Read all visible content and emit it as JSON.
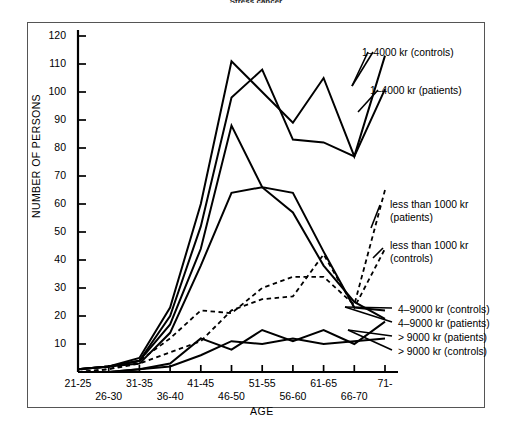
{
  "figure": {
    "title_partial": "Stress cancer",
    "axis_title_x": "AGE",
    "axis_title_y": "NUMBER OF PERSONS"
  },
  "legend": {
    "items": [
      {
        "key": "c1_4000_controls",
        "label": "1–4000 kr (controls)",
        "style": "solid"
      },
      {
        "key": "c1_4000_patients",
        "label": "1–4000 kr (patients)",
        "style": "solid"
      },
      {
        "key": "lt1000_patients_l1",
        "label": "less than 1000 kr",
        "style": "dashed"
      },
      {
        "key": "lt1000_patients_l2",
        "label": "(patients)",
        "style": "dashed"
      },
      {
        "key": "lt1000_controls_l1",
        "label": "less than 1000 kr",
        "style": "dashed"
      },
      {
        "key": "lt1000_controls_l2",
        "label": "(controls)",
        "style": "dashed"
      },
      {
        "key": "c4_9000_controls",
        "label": "4–9000 kr (controls)",
        "style": "solid"
      },
      {
        "key": "c4_9000_patients",
        "label": "4–9000 kr (patients)",
        "style": "solid"
      },
      {
        "key": "gt9000_patients",
        "label": "> 9000 kr (patients)",
        "style": "solid"
      },
      {
        "key": "gt9000_controls",
        "label": "> 9000 kr (controls)",
        "style": "solid"
      }
    ]
  },
  "chart_data": {
    "type": "line",
    "title": "Stress cancer",
    "xlabel": "AGE",
    "ylabel": "NUMBER OF PERSONS",
    "grid": false,
    "legend_position": "right-inline-annotations",
    "ylim": [
      0,
      125
    ],
    "yticks": [
      10,
      20,
      30,
      40,
      50,
      60,
      70,
      80,
      90,
      100,
      110,
      120
    ],
    "categories": [
      "21-25",
      "26-30",
      "31-35",
      "36-40",
      "41-45",
      "46-50",
      "51-55",
      "56-60",
      "61-65",
      "66-70",
      "71-"
    ],
    "series": [
      {
        "name": "1-4000 kr (controls)",
        "style": "solid",
        "values": [
          1,
          2,
          5,
          23,
          60,
          111,
          100,
          89,
          105,
          77,
          113
        ]
      },
      {
        "name": "1-4000 kr (patients)",
        "style": "solid",
        "values": [
          1,
          2,
          4,
          20,
          52,
          98,
          108,
          83,
          82,
          77,
          101
        ]
      },
      {
        "name": "less than 1000 kr (patients)",
        "style": "dashed",
        "values": [
          0,
          1,
          4,
          12,
          22,
          21,
          30,
          34,
          34,
          24,
          65
        ]
      },
      {
        "name": "less than 1000 kr (controls)",
        "style": "dashed",
        "values": [
          0,
          1,
          3,
          7,
          11,
          22,
          26,
          27,
          42,
          23,
          44
        ]
      },
      {
        "name": "4-9000 kr (controls)",
        "style": "solid",
        "values": [
          1,
          2,
          4,
          17,
          44,
          88,
          66,
          64,
          43,
          23,
          22
        ]
      },
      {
        "name": "4-9000 kr (patients)",
        "style": "solid",
        "values": [
          1,
          2,
          3,
          14,
          38,
          64,
          66,
          57,
          38,
          25,
          19
        ]
      },
      {
        "name": "> 9000 kr (patients)",
        "style": "solid",
        "values": [
          0,
          0,
          1,
          3,
          12,
          8,
          15,
          11,
          15,
          10,
          18
        ]
      },
      {
        "name": "> 9000 kr (controls)",
        "style": "solid",
        "values": [
          0,
          0,
          1,
          2,
          6,
          11,
          10,
          12,
          10,
          11,
          12
        ]
      }
    ]
  }
}
